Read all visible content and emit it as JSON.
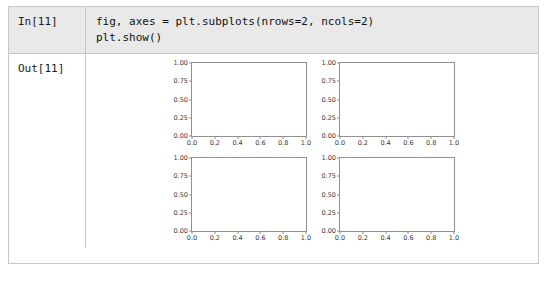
{
  "notebook": {
    "input_cell": {
      "label": "In[11]",
      "code_lines": [
        "fig, axes = plt.subplots(nrows=2, ncols=2)",
        "plt.show()"
      ]
    },
    "output_cell": {
      "label": "Out[11]"
    }
  },
  "colors": {
    "input_cell_background": "#e9e9e9",
    "output_cell_background": "#ffffff",
    "table_border": "#c8c8c8",
    "axes_line": "#909090",
    "tick_label": "#3a3a3a",
    "code_text": "#111111"
  },
  "chart_data": {
    "type": "line",
    "title": "",
    "layout": {
      "nrows": 2,
      "ncols": 2
    },
    "subplots": [
      {
        "position": "row0-col0",
        "series": [],
        "title": "",
        "xlabel": "",
        "ylabel": "",
        "xlim": [
          0.0,
          1.0
        ],
        "ylim": [
          0.0,
          1.0
        ],
        "xticks": [
          0.0,
          0.2,
          0.4,
          0.6,
          0.8,
          1.0
        ],
        "yticks": [
          0.0,
          0.25,
          0.5,
          0.75,
          1.0
        ],
        "xticklabels": [
          "0.0",
          "0.2",
          "0.4",
          "0.6",
          "0.8",
          "1.0"
        ],
        "yticklabels": [
          "0.00",
          "0.25",
          "0.50",
          "0.75",
          "1.00"
        ],
        "grid": false,
        "legend": null
      },
      {
        "position": "row0-col1",
        "series": [],
        "title": "",
        "xlabel": "",
        "ylabel": "",
        "xlim": [
          0.0,
          1.0
        ],
        "ylim": [
          0.0,
          1.0
        ],
        "xticks": [
          0.0,
          0.2,
          0.4,
          0.6,
          0.8,
          1.0
        ],
        "yticks": [
          0.0,
          0.25,
          0.5,
          0.75,
          1.0
        ],
        "xticklabels": [
          "0.0",
          "0.2",
          "0.4",
          "0.6",
          "0.8",
          "1.0"
        ],
        "yticklabels": [
          "0.00",
          "0.25",
          "0.50",
          "0.75",
          "1.00"
        ],
        "grid": false,
        "legend": null
      },
      {
        "position": "row1-col0",
        "series": [],
        "title": "",
        "xlabel": "",
        "ylabel": "",
        "xlim": [
          0.0,
          1.0
        ],
        "ylim": [
          0.0,
          1.0
        ],
        "xticks": [
          0.0,
          0.2,
          0.4,
          0.6,
          0.8,
          1.0
        ],
        "yticks": [
          0.0,
          0.25,
          0.5,
          0.75,
          1.0
        ],
        "xticklabels": [
          "0.0",
          "0.2",
          "0.4",
          "0.6",
          "0.8",
          "1.0"
        ],
        "yticklabels": [
          "0.00",
          "0.25",
          "0.50",
          "0.75",
          "1.00"
        ],
        "grid": false,
        "legend": null
      },
      {
        "position": "row1-col1",
        "series": [],
        "title": "",
        "xlabel": "",
        "ylabel": "",
        "xlim": [
          0.0,
          1.0
        ],
        "ylim": [
          0.0,
          1.0
        ],
        "xticks": [
          0.0,
          0.2,
          0.4,
          0.6,
          0.8,
          1.0
        ],
        "yticks": [
          0.0,
          0.25,
          0.5,
          0.75,
          1.0
        ],
        "xticklabels": [
          "0.0",
          "0.2",
          "0.4",
          "0.6",
          "0.8",
          "1.0"
        ],
        "yticklabels": [
          "0.00",
          "0.25",
          "0.50",
          "0.75",
          "1.00"
        ],
        "grid": false,
        "legend": null
      }
    ]
  }
}
